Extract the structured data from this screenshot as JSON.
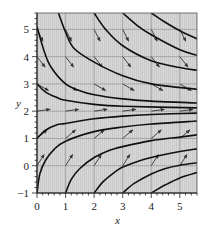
{
  "chart_data": {
    "type": "line",
    "title": "",
    "xlabel": "x",
    "ylabel": "y",
    "xlim": [
      0,
      5.6
    ],
    "ylim": [
      -1,
      5.6
    ],
    "xticks": [
      0,
      1,
      2,
      3,
      4,
      5
    ],
    "yticks": [
      -1,
      0,
      1,
      2,
      3,
      4,
      5
    ],
    "grid": true,
    "legend": null,
    "equilibrium_y": 2.2,
    "slope_field": {
      "x_points": [
        0,
        1,
        2,
        3,
        4,
        5
      ],
      "y_points": [
        0,
        1,
        2,
        3,
        4,
        5
      ],
      "slope_note": "slope depends only on y; positive below ~2.2, negative above"
    },
    "series": [
      {
        "name": "curve-top-1",
        "points": [
          [
            0.75,
            5.6
          ],
          [
            1.0,
            4.9
          ],
          [
            1.3,
            4.3
          ],
          [
            2.0,
            3.8
          ],
          [
            3.0,
            3.3
          ],
          [
            4.0,
            3.0
          ],
          [
            5.6,
            2.8
          ]
        ]
      },
      {
        "name": "curve-top-2",
        "points": [
          [
            2.0,
            5.6
          ],
          [
            2.4,
            5.0
          ],
          [
            3.0,
            4.4
          ],
          [
            4.0,
            3.85
          ],
          [
            5.0,
            3.6
          ],
          [
            5.6,
            3.5
          ]
        ]
      },
      {
        "name": "curve-top-3",
        "points": [
          [
            3.0,
            5.6
          ],
          [
            3.5,
            5.15
          ],
          [
            4.0,
            4.8
          ],
          [
            5.0,
            4.25
          ],
          [
            5.6,
            4.05
          ]
        ]
      },
      {
        "name": "curve-top-4",
        "points": [
          [
            4.0,
            5.6
          ],
          [
            4.5,
            5.25
          ],
          [
            5.0,
            4.95
          ],
          [
            5.6,
            4.65
          ]
        ]
      },
      {
        "name": "curve-left-5",
        "points": [
          [
            0.0,
            5.1
          ],
          [
            0.25,
            4.2
          ],
          [
            0.5,
            3.6
          ],
          [
            1.0,
            3.0
          ],
          [
            1.5,
            2.75
          ],
          [
            2.0,
            2.6
          ],
          [
            3.0,
            2.45
          ],
          [
            4.0,
            2.37
          ],
          [
            5.6,
            2.3
          ]
        ]
      },
      {
        "name": "curve-left-3",
        "points": [
          [
            0.0,
            3.0
          ],
          [
            0.3,
            2.7
          ],
          [
            0.7,
            2.5
          ],
          [
            1.0,
            2.4
          ],
          [
            2.0,
            2.25
          ],
          [
            3.0,
            2.18
          ],
          [
            5.6,
            2.12
          ]
        ]
      },
      {
        "name": "curve-left-1",
        "points": [
          [
            0.0,
            1.0
          ],
          [
            0.3,
            1.3
          ],
          [
            0.7,
            1.5
          ],
          [
            1.0,
            1.55
          ],
          [
            2.0,
            1.72
          ],
          [
            3.0,
            1.82
          ],
          [
            4.0,
            1.88
          ],
          [
            5.6,
            1.93
          ]
        ]
      },
      {
        "name": "curve-bottom-0",
        "points": [
          [
            0.0,
            -1.0
          ],
          [
            0.1,
            -0.3
          ],
          [
            0.3,
            0.2
          ],
          [
            0.6,
            0.6
          ],
          [
            1.0,
            0.9
          ],
          [
            2.0,
            1.25
          ],
          [
            3.0,
            1.42
          ],
          [
            4.0,
            1.53
          ],
          [
            5.6,
            1.64
          ]
        ]
      },
      {
        "name": "curve-bottom-1",
        "points": [
          [
            1.0,
            -1.0
          ],
          [
            1.2,
            -0.5
          ],
          [
            1.5,
            -0.1
          ],
          [
            2.0,
            0.3
          ],
          [
            2.5,
            0.55
          ],
          [
            3.0,
            0.7
          ],
          [
            4.0,
            0.92
          ],
          [
            5.0,
            1.05
          ],
          [
            5.6,
            1.13
          ]
        ]
      },
      {
        "name": "curve-bottom-2",
        "points": [
          [
            2.0,
            -1.0
          ],
          [
            2.3,
            -0.6
          ],
          [
            2.7,
            -0.25
          ],
          [
            3.0,
            -0.05
          ],
          [
            3.5,
            0.15
          ],
          [
            4.0,
            0.3
          ],
          [
            5.0,
            0.52
          ],
          [
            5.6,
            0.62
          ]
        ]
      },
      {
        "name": "curve-bottom-3",
        "points": [
          [
            3.0,
            -1.0
          ],
          [
            3.4,
            -0.65
          ],
          [
            4.0,
            -0.3
          ],
          [
            4.5,
            -0.1
          ],
          [
            5.0,
            0.02
          ],
          [
            5.6,
            0.11
          ]
        ]
      },
      {
        "name": "curve-bottom-4",
        "points": [
          [
            4.0,
            -1.0
          ],
          [
            4.5,
            -0.7
          ],
          [
            5.0,
            -0.45
          ],
          [
            5.6,
            -0.25
          ]
        ]
      }
    ]
  },
  "axes": {
    "x_label": "x",
    "y_label": "y",
    "x_tick_labels": [
      "0",
      "1",
      "2",
      "3",
      "4",
      "5"
    ],
    "y_tick_labels": [
      "-1",
      "0",
      "1",
      "2",
      "3",
      "4",
      "5"
    ]
  },
  "colors": {
    "plot_bg": "#d7d7d7",
    "hatch": "#c9c9c9",
    "grid": "#9a9a9a",
    "curve": "#111111",
    "arrow": "#333333",
    "frame": "#555555"
  }
}
